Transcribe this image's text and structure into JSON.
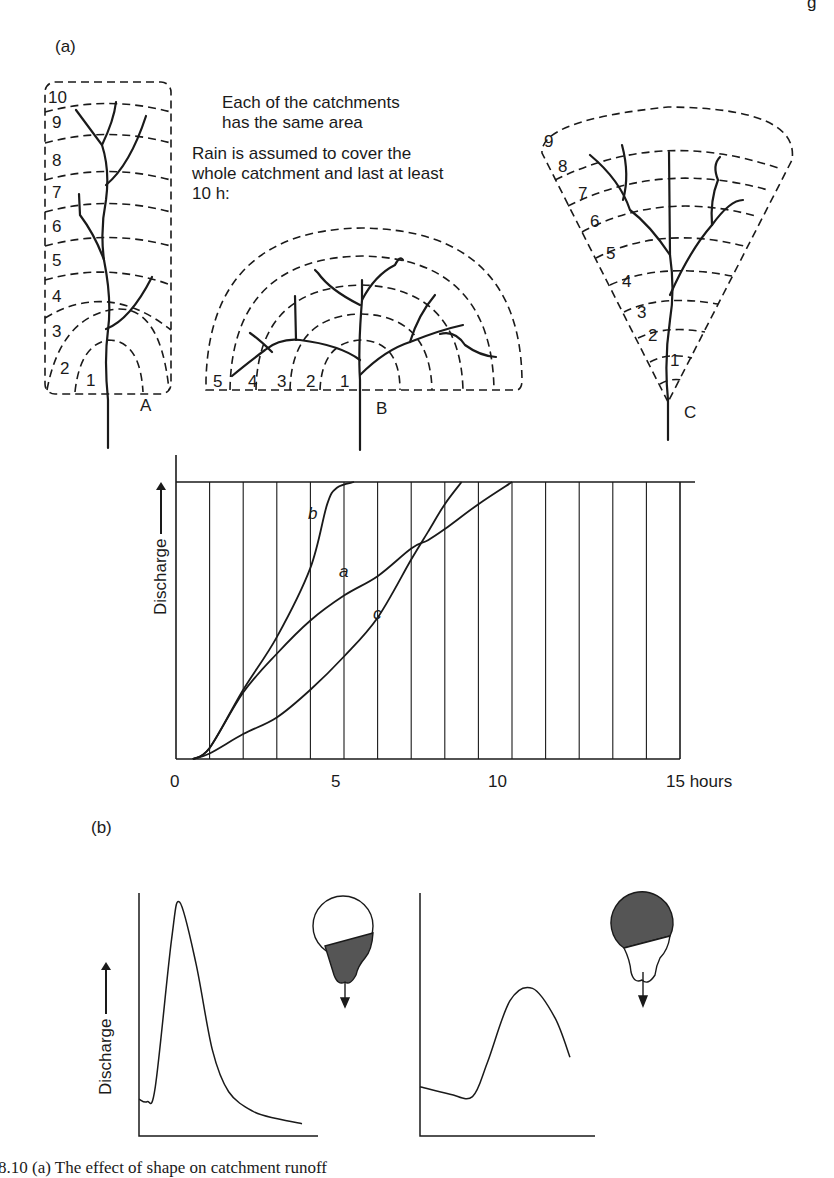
{
  "page": {
    "header_fragment": "g",
    "caption": "8.10 (a) The effect of shape on catchment runoff",
    "colors": {
      "ink": "#1a1a1a",
      "shading": "#555555",
      "paper": "#ffffff"
    }
  },
  "panel_a": {
    "label": "(a)",
    "note_area": [
      "Each of the catchments",
      "has the same area"
    ],
    "note_rain": [
      "Rain is assumed to cover the",
      "whole catchment and last at least",
      "10 h:"
    ],
    "catchments": [
      {
        "id": "A",
        "shape": "elongated rectangle",
        "isochrone_zones": [
          "1",
          "2",
          "3",
          "4",
          "5",
          "6",
          "7",
          "8",
          "9",
          "10"
        ]
      },
      {
        "id": "B",
        "shape": "semicircle",
        "isochrone_zones": [
          "1",
          "2",
          "3",
          "4",
          "5"
        ]
      },
      {
        "id": "C",
        "shape": "fan / sector",
        "isochrone_zones": [
          "1",
          "2",
          "3",
          "4",
          "5",
          "6",
          "7",
          "8",
          "9"
        ]
      }
    ]
  },
  "chart_data": [
    {
      "type": "line",
      "title": "Cumulative discharge curves for catchments A, B, C",
      "xlabel": "hours",
      "ylabel": "Discharge",
      "x_ticks": [
        "0",
        "5",
        "10",
        "15 hours"
      ],
      "xlim": [
        0,
        15
      ],
      "ylim": [
        0,
        1
      ],
      "grid": "vertical lines every 1 hour",
      "series": [
        {
          "name": "a",
          "x": [
            0.5,
            1,
            2,
            3,
            4,
            5,
            6,
            7,
            7.5,
            8,
            9,
            10
          ],
          "y": [
            0,
            0.04,
            0.24,
            0.38,
            0.5,
            0.59,
            0.66,
            0.76,
            0.79,
            0.83,
            0.92,
            1.0
          ]
        },
        {
          "name": "b",
          "x": [
            0.5,
            1,
            2,
            3,
            4,
            4.5,
            4.8,
            5.3
          ],
          "y": [
            0,
            0.04,
            0.25,
            0.44,
            0.69,
            0.92,
            0.98,
            1.0
          ]
        },
        {
          "name": "c",
          "x": [
            0.5,
            1,
            2,
            3,
            4,
            5,
            6,
            7,
            7.5,
            8,
            8.5
          ],
          "y": [
            0,
            0.02,
            0.09,
            0.15,
            0.25,
            0.37,
            0.51,
            0.72,
            0.82,
            0.92,
            1.0
          ]
        }
      ],
      "series_labels": [
        "a",
        "b",
        "c"
      ]
    },
    {
      "type": "line",
      "title": "Hydrograph: catchment with area concentrated near outlet",
      "ylabel": "Discharge",
      "shape": "sharp early high peak, quick recession",
      "x": [
        0,
        0.05,
        0.1,
        0.2,
        0.25,
        0.35,
        0.45,
        0.55,
        0.7,
        0.85,
        1.0
      ],
      "y": [
        0.15,
        0.14,
        0.2,
        0.8,
        0.95,
        0.7,
        0.35,
        0.18,
        0.1,
        0.07,
        0.05
      ]
    },
    {
      "type": "line",
      "title": "Hydrograph: catchment with area concentrated far from outlet",
      "shape": "low delayed broad peak",
      "x": [
        0,
        0.2,
        0.35,
        0.45,
        0.6,
        0.75,
        0.9,
        1.0
      ],
      "y": [
        0.2,
        0.17,
        0.16,
        0.3,
        0.55,
        0.6,
        0.48,
        0.32
      ]
    }
  ],
  "panel_b": {
    "label": "(b)",
    "ylabel_left": "Discharge",
    "icons": [
      "catchment-shaded-lower-icon",
      "catchment-shaded-upper-icon"
    ]
  }
}
